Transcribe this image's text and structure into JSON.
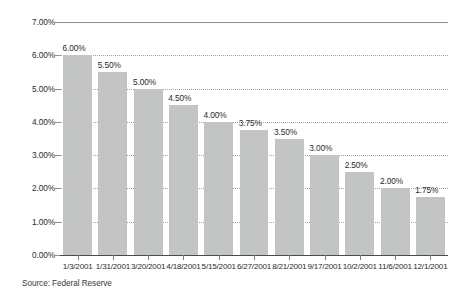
{
  "chart_data": {
    "type": "bar",
    "title": "",
    "subtitle": "",
    "xlabel": "",
    "ylabel": "",
    "categories": [
      "1/3/2001",
      "1/31/2001",
      "3/20/2001",
      "4/18/2001",
      "5/15/2001",
      "6/27/2001",
      "8/21/2001",
      "9/17/2001",
      "10/2/2001",
      "11/6/2001",
      "12/1/2001"
    ],
    "values": [
      6.0,
      5.5,
      5.0,
      4.5,
      4.0,
      3.75,
      3.5,
      3.0,
      2.5,
      2.0,
      1.75
    ],
    "value_labels": [
      "6.00%",
      "5.50%",
      "5.00%",
      "4.50%",
      "4.00%",
      "3.75%",
      "3.50%",
      "3.00%",
      "2.50%",
      "2.00%",
      "1.75%"
    ],
    "ylim": [
      0,
      7
    ],
    "ytick_values": [
      0,
      1,
      2,
      3,
      4,
      5,
      6,
      7
    ],
    "ytick_labels": [
      "0.00%",
      "1.00%",
      "2.00%",
      "3.00%",
      "4.00%",
      "5.00%",
      "6.00%",
      "7.00%"
    ],
    "grid": "horizontal-dotted",
    "legend": "none",
    "bar_color": "#c3c4c4",
    "grid_color": "#9fa3a6",
    "axis_color": "#4a4a4a",
    "text_color": "#2b2b2b"
  },
  "footer": {
    "source": "Source: Federal Reserve"
  }
}
